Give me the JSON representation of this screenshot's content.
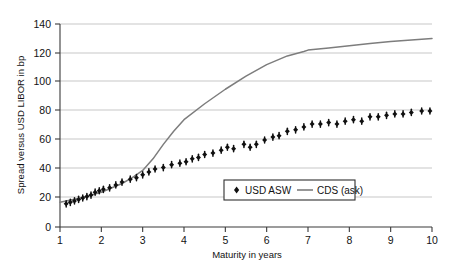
{
  "chart_data": {
    "type": "scatter",
    "title": "",
    "xlabel": "Maturity in years",
    "ylabel": "Spread versus USD LIBOR in bp",
    "xlim": [
      1,
      10
    ],
    "ylim": [
      0,
      140
    ],
    "grid": true,
    "legend_position": "inside-lower-right",
    "xticks": [
      1,
      2,
      3,
      4,
      5,
      6,
      7,
      8,
      9,
      10
    ],
    "yticks": [
      0,
      20,
      40,
      60,
      80,
      100,
      120,
      140
    ],
    "xtick_labels": [
      "1",
      "2",
      "3",
      "4",
      "5",
      "6",
      "7",
      "8",
      "9",
      "10"
    ],
    "ytick_labels": [
      "0",
      "20",
      "40",
      "60",
      "80",
      "100",
      "120",
      "140"
    ],
    "series": [
      {
        "name": "USD ASW",
        "marker": "diamond-with-vertical-bar",
        "color": "#101010",
        "x": [
          1.15,
          1.25,
          1.35,
          1.45,
          1.55,
          1.65,
          1.75,
          1.85,
          1.95,
          2.05,
          2.2,
          2.35,
          2.5,
          2.7,
          2.85,
          3.0,
          3.15,
          3.3,
          3.5,
          3.7,
          3.9,
          4.05,
          4.2,
          4.35,
          4.5,
          4.7,
          4.9,
          5.05,
          5.2,
          5.45,
          5.6,
          5.75,
          5.95,
          6.15,
          6.3,
          6.5,
          6.7,
          6.9,
          7.1,
          7.3,
          7.5,
          7.7,
          7.9,
          8.1,
          8.3,
          8.5,
          8.7,
          8.9,
          9.1,
          9.3,
          9.5,
          9.75,
          9.95
        ],
        "y": [
          16,
          17,
          18,
          19,
          20,
          21,
          22,
          24,
          25,
          26,
          27,
          29,
          31,
          33,
          34,
          36,
          38,
          40,
          41,
          43,
          44,
          45,
          47,
          48,
          50,
          51,
          53,
          55,
          54,
          57,
          55,
          57,
          60,
          62,
          63,
          66,
          67,
          69,
          71,
          71,
          72,
          71,
          73,
          74,
          73,
          76,
          76,
          77,
          78,
          78,
          79,
          80,
          80
        ]
      },
      {
        "name": "CDS (ask)",
        "marker": "line",
        "color": "#7d7d7d",
        "x": [
          1.0,
          1.5,
          2.0,
          2.5,
          2.75,
          3.0,
          3.25,
          3.5,
          3.75,
          4.0,
          4.5,
          5.0,
          5.5,
          6.0,
          6.5,
          6.9,
          7.0,
          7.5,
          8.0,
          8.5,
          9.0,
          9.5,
          10.0
        ],
        "y": [
          17,
          20,
          24,
          30,
          34,
          39,
          47,
          57,
          66,
          74,
          85,
          95,
          104,
          112,
          118,
          121,
          122,
          123.5,
          125,
          126.5,
          128,
          129,
          130
        ]
      }
    ]
  },
  "legend": {
    "items": [
      {
        "label": "USD ASW",
        "marker": "point"
      },
      {
        "label": "CDS (ask)",
        "marker": "line"
      }
    ]
  }
}
